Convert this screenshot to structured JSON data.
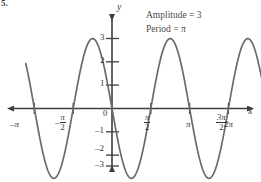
{
  "problem_number": "5.",
  "annotations": [
    {
      "id": "amplitude",
      "text": "Amplitude = 3"
    },
    {
      "id": "period",
      "text": "Period = π"
    }
  ],
  "axes": {
    "y_label": "y",
    "x_label": "x",
    "origin_label": "0"
  },
  "y_ticks": [
    {
      "value": 3,
      "label": "3"
    },
    {
      "value": 2,
      "label": "2"
    },
    {
      "value": 1,
      "label": "1"
    },
    {
      "value": -1,
      "label": "–1"
    },
    {
      "value": -2,
      "label": "–2"
    },
    {
      "value": -3,
      "label": "–3"
    }
  ],
  "x_ticks": [
    {
      "value": -3.14159,
      "label": "–π",
      "type": "plain"
    },
    {
      "value": -1.5708,
      "label": "–π/2",
      "type": "fraction",
      "sign": "–",
      "num": "π",
      "den": "2"
    },
    {
      "value": 1.5708,
      "label": "π/2",
      "type": "fraction",
      "sign": "",
      "num": "π",
      "den": "2"
    },
    {
      "value": 3.14159,
      "label": "π",
      "type": "plain"
    },
    {
      "value": 4.71239,
      "label": "3π/2",
      "type": "fraction",
      "sign": "",
      "num": "3π",
      "den": "2"
    },
    {
      "value": 6.28319,
      "label": "2π",
      "type": "plain"
    }
  ],
  "chart_data": {
    "type": "line",
    "title": "",
    "xlabel": "x",
    "ylabel": "y",
    "function": "y = -3 sin(2x)",
    "amplitude": 3,
    "period": 3.14159,
    "xlim": [
      -3.4907,
      6.8068
    ],
    "ylim": [
      -3.9,
      3.9
    ],
    "grid": false,
    "legend": false,
    "xtick_labels": [
      "–π",
      "–π/2",
      "0",
      "π/2",
      "π",
      "3π/2",
      "2π"
    ],
    "xtick_values": [
      -3.14159,
      -1.5708,
      0,
      1.5708,
      3.14159,
      4.71239,
      6.28319
    ],
    "ytick_labels": [
      "–3",
      "–2",
      "–1",
      "1",
      "2",
      "3"
    ],
    "ytick_values": [
      -3,
      -2,
      -1,
      1,
      2,
      3
    ],
    "zero_crossings": [
      -3.14159,
      -1.5708,
      0,
      1.5708,
      3.14159,
      4.71239,
      6.28319
    ],
    "maxima": [
      {
        "x": -2.35619,
        "y": 3
      },
      {
        "x": 0.7854,
        "y": 3
      },
      {
        "x": 3.92699,
        "y": 3
      }
    ],
    "minima": [
      {
        "x": -0.7854,
        "y": -3
      },
      {
        "x": 2.35619,
        "y": -3
      },
      {
        "x": 5.49779,
        "y": -3
      }
    ],
    "curve_color": "#6b6b6b",
    "axis_color": "#3f3f3f"
  },
  "colors": {
    "background": "#ffffff",
    "curve": "#6b6b6b",
    "axis": "#3f3f3f",
    "text": "#333333",
    "annotation": "#4a4a4a"
  }
}
